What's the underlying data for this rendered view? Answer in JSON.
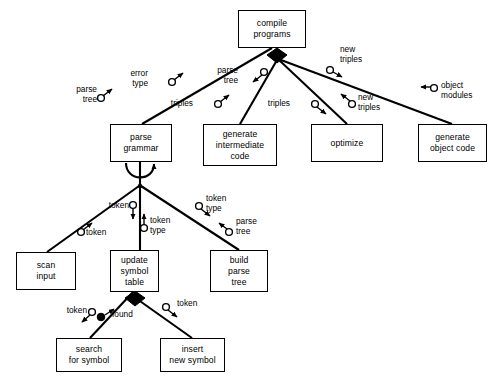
{
  "diagram": {
    "type": "structure-chart",
    "line_color": "#000000",
    "background": "#ffffff",
    "nodes": [
      {
        "id": "compile",
        "label": "compile\nprograms",
        "x": 238,
        "y": 10,
        "w": 68,
        "h": 38
      },
      {
        "id": "parsegram",
        "label": "parse\ngrammar",
        "x": 110,
        "y": 124,
        "w": 62,
        "h": 38
      },
      {
        "id": "genint",
        "label": "generate\nintermediate\ncode",
        "x": 203,
        "y": 124,
        "w": 74,
        "h": 42
      },
      {
        "id": "optimize",
        "label": "optimize",
        "x": 311,
        "y": 124,
        "w": 72,
        "h": 38
      },
      {
        "id": "genobj",
        "label": "generate\nobject code",
        "x": 418,
        "y": 124,
        "w": 69,
        "h": 38
      },
      {
        "id": "scan",
        "label": "scan\ninput",
        "x": 16,
        "y": 252,
        "w": 60,
        "h": 38
      },
      {
        "id": "update",
        "label": "update\nsymbol\ntable",
        "x": 110,
        "y": 250,
        "w": 49,
        "h": 42
      },
      {
        "id": "build",
        "label": "build\nparse\ntree",
        "x": 210,
        "y": 250,
        "w": 58,
        "h": 42
      },
      {
        "id": "search",
        "label": "search\nfor symbol",
        "x": 56,
        "y": 338,
        "w": 66,
        "h": 34
      },
      {
        "id": "insert",
        "label": "insert\nnew symbol",
        "x": 160,
        "y": 338,
        "w": 65,
        "h": 34
      }
    ],
    "edge_labels": [
      {
        "id": "parse-tree-left",
        "text": "parse\ntree",
        "x": 97,
        "y": 85,
        "align": "right"
      },
      {
        "id": "error-type",
        "text": "error\ntype",
        "x": 148,
        "y": 69,
        "align": "right"
      },
      {
        "id": "triples-left",
        "text": "triples",
        "x": 193,
        "y": 101,
        "align": "right"
      },
      {
        "id": "parse-tree-mid",
        "text": "parse\ntree",
        "x": 238,
        "y": 68,
        "align": "right"
      },
      {
        "id": "triples-mid",
        "text": "triples",
        "x": 290,
        "y": 101,
        "align": "right"
      },
      {
        "id": "new-triples-low",
        "text": "new\ntriples",
        "x": 358,
        "y": 94,
        "align": "left"
      },
      {
        "id": "new-triples-top",
        "text": "new\ntriples",
        "x": 342,
        "y": 46,
        "align": "left"
      },
      {
        "id": "object-modules",
        "text": "object\nmodules",
        "x": 440,
        "y": 84,
        "align": "left"
      },
      {
        "id": "token-upper",
        "text": "token",
        "x": 99,
        "y": 210,
        "align": "right"
      },
      {
        "id": "token-lower",
        "text": "token",
        "x": 85,
        "y": 230,
        "align": "left"
      },
      {
        "id": "token-type-mid",
        "text": "token\ntype",
        "x": 150,
        "y": 218,
        "align": "left"
      },
      {
        "id": "token-type-right",
        "text": "token\ntype",
        "x": 204,
        "y": 196,
        "align": "left"
      },
      {
        "id": "parse-tree-build",
        "text": "parse\ntree",
        "x": 235,
        "y": 219,
        "align": "left"
      },
      {
        "id": "token-search",
        "text": "token",
        "x": 58,
        "y": 310,
        "align": "right"
      },
      {
        "id": "found",
        "text": "found",
        "x": 111,
        "y": 315,
        "align": "left"
      },
      {
        "id": "token-insert",
        "text": "token",
        "x": 176,
        "y": 303,
        "align": "left"
      }
    ]
  }
}
